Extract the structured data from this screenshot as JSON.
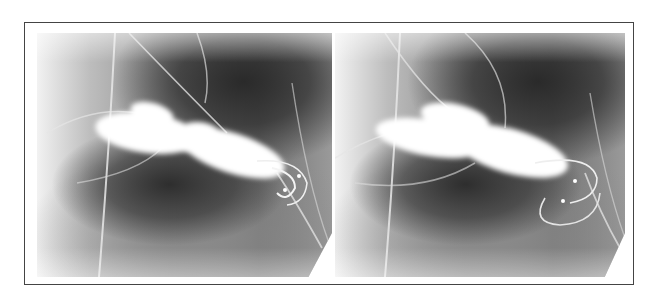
{
  "figure": {
    "panels": [
      {
        "id": "left",
        "label": ""
      },
      {
        "id": "right",
        "label": ""
      }
    ],
    "colors": {
      "border": "#444444",
      "background": "#ffffff",
      "contrast": "#ffffff",
      "dark_region": "#2a2a2a"
    }
  }
}
